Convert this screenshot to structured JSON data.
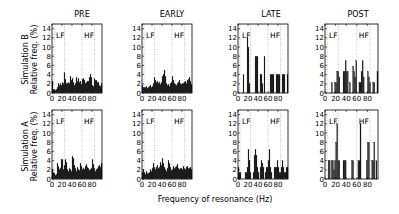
{
  "figure": {
    "columns": [
      "PRE",
      "EARLY",
      "LATE",
      "POST"
    ],
    "rows": [
      {
        "label_line1": "Simulation B",
        "label_line2": "Relative freq. (%)"
      },
      {
        "label_line1": "Simulation A",
        "label_line2": "Relative freq. (%)"
      }
    ],
    "xlabel": "Frequency of resonance (Hz)",
    "band_labels": {
      "lf": "LF",
      "hf": "HF"
    }
  },
  "chart_data": [
    {
      "type": "bar",
      "row": "Simulation B",
      "title": "PRE",
      "xlabel": "",
      "ylabel": "Relative freq. (%)",
      "xlim": [
        0,
        100
      ],
      "ylim": [
        0,
        15
      ],
      "xticks": [
        0,
        20,
        40,
        60,
        80
      ],
      "yticks": [
        0,
        2,
        4,
        6,
        8,
        10,
        12,
        14
      ],
      "annotations": [
        "LF",
        "HF"
      ],
      "vlines": [
        4,
        25,
        60,
        85
      ],
      "bin_width": 2,
      "x": [
        0,
        2,
        4,
        6,
        8,
        10,
        12,
        14,
        16,
        18,
        20,
        22,
        24,
        26,
        28,
        30,
        32,
        34,
        36,
        38,
        40,
        42,
        44,
        46,
        48,
        50,
        52,
        54,
        56,
        58,
        60,
        62,
        64,
        66,
        68,
        70,
        72,
        74,
        76,
        78,
        80,
        82,
        84,
        86,
        88,
        90,
        92,
        94,
        96,
        98
      ],
      "values": [
        2.6,
        0.8,
        0.8,
        0.6,
        0.8,
        1.2,
        2,
        1.6,
        2,
        1.6,
        2.2,
        2,
        4.4,
        3,
        2,
        2,
        2.2,
        2,
        3.6,
        2.8,
        3.2,
        2.2,
        1.6,
        2,
        3.4,
        2.6,
        3.2,
        2.2,
        2.6,
        1.8,
        3,
        3.2,
        2.8,
        2,
        2.2,
        2.6,
        2.6,
        3.4,
        4.1,
        3.4,
        1.6,
        1.4,
        3.1,
        2.8,
        2.8,
        2.2,
        2.4,
        1.6,
        1.4,
        2
      ]
    },
    {
      "type": "bar",
      "row": "Simulation B",
      "title": "EARLY",
      "xlim": [
        0,
        100
      ],
      "ylim": [
        0,
        15
      ],
      "xticks": [
        0,
        20,
        40,
        60,
        80
      ],
      "yticks": [
        0,
        2,
        4,
        6,
        8,
        10,
        12,
        14
      ],
      "annotations": [
        "LF",
        "HF"
      ],
      "vlines": [
        4,
        25,
        60,
        85
      ],
      "bin_width": 2,
      "x": [
        0,
        2,
        4,
        6,
        8,
        10,
        12,
        14,
        16,
        18,
        20,
        22,
        24,
        26,
        28,
        30,
        32,
        34,
        36,
        38,
        40,
        42,
        44,
        46,
        48,
        50,
        52,
        54,
        56,
        58,
        60,
        62,
        64,
        66,
        68,
        70,
        72,
        74,
        76,
        78,
        80,
        82,
        84,
        86,
        88,
        90,
        92,
        94,
        96,
        98
      ],
      "values": [
        1.6,
        1.2,
        1.2,
        1.2,
        1.4,
        1,
        1.2,
        1.4,
        1.6,
        1.2,
        1.4,
        2,
        3.4,
        2.8,
        2.2,
        2.6,
        2,
        2.4,
        1.8,
        2.2,
        3.6,
        4,
        5,
        3.6,
        2,
        1.6,
        1.8,
        1.4,
        2,
        2.4,
        3.6,
        2.8,
        2,
        1.8,
        1.6,
        2,
        2.4,
        2.8,
        2,
        1.8,
        2,
        2,
        2.4,
        2.6,
        2,
        2.8,
        3,
        3.4,
        2.6,
        1.8
      ]
    },
    {
      "type": "bar",
      "row": "Simulation B",
      "title": "LATE",
      "xlim": [
        0,
        100
      ],
      "ylim": [
        0,
        15
      ],
      "xticks": [
        0,
        20,
        40,
        60,
        80
      ],
      "yticks": [
        0,
        2,
        4,
        6,
        8,
        10,
        12,
        14
      ],
      "annotations": [
        "LF",
        "HF"
      ],
      "vlines": [
        4,
        25,
        60,
        85
      ],
      "bin_width": 2,
      "x": [
        0,
        2,
        4,
        6,
        8,
        10,
        12,
        14,
        16,
        18,
        20,
        22,
        24,
        26,
        28,
        30,
        32,
        34,
        36,
        38,
        40,
        42,
        44,
        46,
        48,
        50,
        52,
        54,
        56,
        58,
        60,
        62,
        64,
        66,
        68,
        70,
        72,
        74,
        76,
        78,
        80,
        82,
        84,
        86,
        88,
        90,
        92,
        94,
        96,
        98
      ],
      "values": [
        0,
        0,
        0,
        0,
        0,
        4,
        0,
        0,
        0,
        12,
        10,
        2,
        0,
        0,
        0,
        0,
        0,
        8,
        8,
        8,
        0,
        0,
        4,
        4,
        2,
        0,
        8,
        0,
        0,
        0,
        0,
        0,
        4,
        4,
        4,
        4,
        0,
        0,
        4,
        4,
        4,
        4,
        0,
        0,
        4,
        4,
        4,
        0,
        0,
        4
      ]
    },
    {
      "type": "bar",
      "row": "Simulation B",
      "title": "POST",
      "xlim": [
        0,
        100
      ],
      "ylim": [
        0,
        15
      ],
      "xticks": [
        0,
        20,
        40,
        60,
        80
      ],
      "yticks": [
        0,
        2,
        4,
        6,
        8,
        10,
        12,
        14
      ],
      "annotations": [
        "LF",
        "HF"
      ],
      "vlines": [
        4,
        25,
        60,
        85
      ],
      "bin_width": 2,
      "x": [
        0,
        2,
        4,
        6,
        8,
        10,
        12,
        14,
        16,
        18,
        20,
        22,
        24,
        26,
        28,
        30,
        32,
        34,
        36,
        38,
        40,
        42,
        44,
        46,
        48,
        50,
        52,
        54,
        56,
        58,
        60,
        62,
        64,
        66,
        68,
        70,
        72,
        74,
        76,
        78,
        80,
        82,
        84,
        86,
        88,
        90,
        92,
        94,
        96,
        98
      ],
      "values": [
        0,
        0,
        0,
        0,
        0,
        0,
        2.3,
        0,
        0,
        2.3,
        2.3,
        4.7,
        4.7,
        3.5,
        0,
        0,
        0,
        4.7,
        4.7,
        7,
        4.7,
        4.7,
        0,
        2.3,
        0,
        0,
        5.8,
        4.7,
        3.5,
        7,
        0,
        0,
        2.3,
        2.3,
        4.7,
        7,
        3.5,
        0,
        0,
        0,
        4.7,
        3.5,
        2.3,
        0,
        0,
        2.3,
        2.3,
        0,
        0,
        4.7
      ]
    },
    {
      "type": "bar",
      "row": "Simulation A",
      "title": "PRE",
      "xlim": [
        0,
        100
      ],
      "ylim": [
        0,
        15
      ],
      "xticks": [
        0,
        20,
        40,
        60,
        80
      ],
      "yticks": [
        0,
        2,
        4,
        6,
        8,
        10,
        12,
        14
      ],
      "annotations": [
        "LF",
        "HF"
      ],
      "vlines": [
        4,
        25,
        60,
        85
      ],
      "bin_width": 2,
      "x": [
        0,
        2,
        4,
        6,
        8,
        10,
        12,
        14,
        16,
        18,
        20,
        22,
        24,
        26,
        28,
        30,
        32,
        34,
        36,
        38,
        40,
        42,
        44,
        46,
        48,
        50,
        52,
        54,
        56,
        58,
        60,
        62,
        64,
        66,
        68,
        70,
        72,
        74,
        76,
        78,
        80,
        82,
        84,
        86,
        88,
        90,
        92,
        94,
        96,
        98
      ],
      "values": [
        2,
        1.4,
        1.2,
        0.8,
        1,
        3.4,
        2.8,
        2,
        2.4,
        4.2,
        4.2,
        2,
        3,
        4.2,
        3.6,
        2,
        1.6,
        2.2,
        2,
        1.6,
        5,
        4.4,
        3,
        2.2,
        1.6,
        2.6,
        2,
        1.8,
        3.4,
        2.8,
        2,
        2.4,
        2,
        2.8,
        3.2,
        2.6,
        2.2,
        1.8,
        2,
        2.4,
        4.2,
        3.2,
        2.2,
        1.6,
        2,
        2.2,
        2.8,
        3,
        2.6,
        3.4
      ]
    },
    {
      "type": "bar",
      "row": "Simulation A",
      "title": "EARLY",
      "xlim": [
        0,
        100
      ],
      "ylim": [
        0,
        15
      ],
      "xticks": [
        0,
        20,
        40,
        60,
        80
      ],
      "yticks": [
        0,
        2,
        4,
        6,
        8,
        10,
        12,
        14
      ],
      "annotations": [
        "LF",
        "HF"
      ],
      "vlines": [
        4,
        25,
        60,
        85
      ],
      "bin_width": 2,
      "x": [
        0,
        2,
        4,
        6,
        8,
        10,
        12,
        14,
        16,
        18,
        20,
        22,
        24,
        26,
        28,
        30,
        32,
        34,
        36,
        38,
        40,
        42,
        44,
        46,
        48,
        50,
        52,
        54,
        56,
        58,
        60,
        62,
        64,
        66,
        68,
        70,
        72,
        74,
        76,
        78,
        80,
        82,
        84,
        86,
        88,
        90,
        92,
        94,
        96,
        98
      ],
      "values": [
        1.4,
        2,
        1.4,
        1,
        1.6,
        1.2,
        1.2,
        1.4,
        2,
        1.6,
        2.4,
        3.4,
        2.6,
        2,
        2.6,
        3,
        2.2,
        2.6,
        3.6,
        3,
        4.4,
        3.4,
        2.6,
        2,
        1.6,
        2.4,
        4,
        3.4,
        2.6,
        1.8,
        2,
        2.8,
        2.2,
        2.6,
        2.8,
        3.2,
        2.4,
        2,
        2.2,
        2.4,
        2,
        2.8,
        2.2,
        2,
        2.6,
        2.8,
        2.2,
        2.4,
        2.6,
        2
      ]
    },
    {
      "type": "bar",
      "row": "Simulation A",
      "title": "LATE",
      "xlim": [
        0,
        100
      ],
      "ylim": [
        0,
        15
      ],
      "xticks": [
        0,
        20,
        40,
        60,
        80
      ],
      "yticks": [
        0,
        2,
        4,
        6,
        8,
        10,
        12,
        14
      ],
      "annotations": [
        "LF",
        "HF"
      ],
      "vlines": [
        4,
        25,
        60,
        85
      ],
      "bin_width": 2,
      "x": [
        0,
        2,
        4,
        6,
        8,
        10,
        12,
        14,
        16,
        18,
        20,
        22,
        24,
        26,
        28,
        30,
        32,
        34,
        36,
        38,
        40,
        42,
        44,
        46,
        48,
        50,
        52,
        54,
        56,
        58,
        60,
        62,
        64,
        66,
        68,
        70,
        72,
        74,
        76,
        78,
        80,
        82,
        84,
        86,
        88,
        90,
        92,
        94,
        96,
        98
      ],
      "values": [
        2.6,
        1.4,
        1.4,
        0,
        0,
        0,
        0,
        1.4,
        1.4,
        2.6,
        6.4,
        4,
        1.4,
        0,
        0,
        1.4,
        5.2,
        6.4,
        5.2,
        2.6,
        1.4,
        0,
        2.6,
        4,
        3.4,
        2.6,
        0,
        1.4,
        2.6,
        2.6,
        4,
        6.4,
        2.6,
        1.4,
        0,
        0,
        2.6,
        2.6,
        2.6,
        4,
        2.6,
        1.4,
        1.4,
        2.6,
        4,
        2.6,
        1.4,
        1.4,
        2.6,
        2.6
      ]
    },
    {
      "type": "bar",
      "row": "Simulation A",
      "title": "POST",
      "xlim": [
        0,
        100
      ],
      "ylim": [
        0,
        15
      ],
      "xticks": [
        0,
        20,
        40,
        60,
        80
      ],
      "yticks": [
        0,
        2,
        4,
        6,
        8,
        10,
        12,
        14
      ],
      "annotations": [
        "LF",
        "HF"
      ],
      "vlines": [
        4,
        25,
        60,
        85
      ],
      "bin_width": 2,
      "x": [
        0,
        2,
        4,
        6,
        8,
        10,
        12,
        14,
        16,
        18,
        20,
        22,
        24,
        26,
        28,
        30,
        32,
        34,
        36,
        38,
        40,
        42,
        44,
        46,
        48,
        50,
        52,
        54,
        56,
        58,
        60,
        62,
        64,
        66,
        68,
        70,
        72,
        74,
        76,
        78,
        80,
        82,
        84,
        86,
        88,
        90,
        92,
        94,
        96,
        98
      ],
      "values": [
        0,
        0,
        0,
        4,
        4,
        0,
        4,
        4,
        2,
        4,
        8,
        12,
        4,
        4,
        0,
        0,
        0,
        4,
        4,
        4,
        0,
        0,
        0,
        0,
        0,
        4,
        4,
        0,
        0,
        0,
        0,
        4,
        4,
        12,
        0,
        0,
        0,
        0,
        0,
        4,
        8,
        8,
        0,
        0,
        4,
        4,
        8,
        0,
        4,
        0
      ]
    }
  ]
}
